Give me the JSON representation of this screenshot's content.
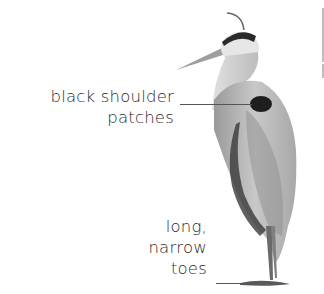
{
  "figure": {
    "labels": [
      {
        "id": "shoulder",
        "lines": [
          "black shoulder",
          "patches"
        ]
      },
      {
        "id": "toes",
        "lines": [
          "long,",
          "narrow",
          "toes"
        ]
      }
    ]
  },
  "colors": {
    "text": "#2b2b2b",
    "leader_line": "#555555",
    "background": "#ffffff"
  }
}
